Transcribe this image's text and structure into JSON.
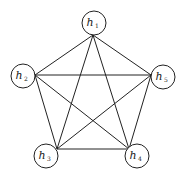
{
  "diagram": {
    "type": "complete-graph",
    "stroke_color": "#222222",
    "background": "#ffffff",
    "nodes": [
      {
        "id": "h1",
        "label": "h",
        "subscript": "1",
        "cx": 94,
        "cy": 23,
        "r": 12,
        "anchor_x": 93,
        "anchor_y": 35
      },
      {
        "id": "h2",
        "label": "h",
        "subscript": "2",
        "cx": 23,
        "cy": 76,
        "r": 12,
        "anchor_x": 35,
        "anchor_y": 75
      },
      {
        "id": "h5",
        "label": "h",
        "subscript": "5",
        "cx": 163,
        "cy": 77,
        "r": 12,
        "anchor_x": 151,
        "anchor_y": 75
      },
      {
        "id": "h3",
        "label": "h",
        "subscript": "3",
        "cx": 46,
        "cy": 156,
        "r": 12,
        "anchor_x": 57,
        "anchor_y": 149
      },
      {
        "id": "h4",
        "label": "h",
        "subscript": "4",
        "cx": 137,
        "cy": 156,
        "r": 12,
        "anchor_x": 129,
        "anchor_y": 149
      }
    ],
    "edges": [
      [
        "h1",
        "h2"
      ],
      [
        "h1",
        "h3"
      ],
      [
        "h1",
        "h4"
      ],
      [
        "h1",
        "h5"
      ],
      [
        "h2",
        "h3"
      ],
      [
        "h2",
        "h4"
      ],
      [
        "h2",
        "h5"
      ],
      [
        "h3",
        "h4"
      ],
      [
        "h3",
        "h5"
      ],
      [
        "h4",
        "h5"
      ]
    ]
  }
}
